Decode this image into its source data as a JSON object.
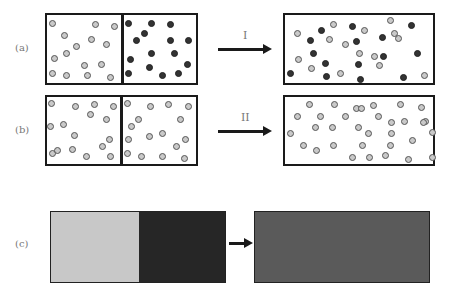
{
  "panels": {
    "a": {
      "label": "(a)",
      "step_label": "I",
      "before_left_particles": "light",
      "before_right_particles": "dark",
      "after_particles": "mixed"
    },
    "b": {
      "label": "(b)",
      "step_label": "II",
      "before_left_particles": "light",
      "before_right_particles": "light",
      "after_particles": "light"
    },
    "c": {
      "label": "(c)",
      "before_left_color": "#c8c8c8",
      "before_right_color": "#262626",
      "after_color": "#5a5a5a"
    }
  },
  "colors": {
    "light_particle": "#c9c9c9",
    "dark_particle": "#333333",
    "border": "#1a1a1a"
  }
}
